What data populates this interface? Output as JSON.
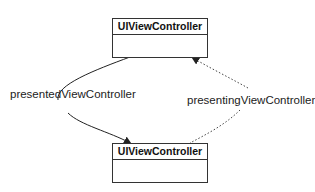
{
  "nodes": {
    "top": {
      "title": "UIViewController"
    },
    "bottom": {
      "title": "UIViewController"
    }
  },
  "edges": {
    "presented": {
      "label": "presentedViewController",
      "style": "solid"
    },
    "presenting": {
      "label": "presentingViewController",
      "style": "dotted"
    }
  }
}
